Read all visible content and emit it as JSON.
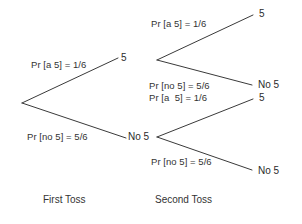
{
  "diagram": {
    "title_visible": false,
    "colors": {
      "background": "#ffffff",
      "line": "#3a3a3a",
      "label_text": "#333333",
      "node_text": "#2b2b2b"
    },
    "stage_labels": [
      {
        "id": "first-toss",
        "text": "First Toss",
        "x": 43,
        "y": 194
      },
      {
        "id": "second-toss",
        "text": "Second Toss",
        "x": 155,
        "y": 194
      }
    ],
    "branch_labels": [
      {
        "id": "first-a5",
        "text": "Pr [a 5] = 1/6",
        "x": 31,
        "y": 59
      },
      {
        "id": "first-no5",
        "text": "Pr [no 5] = 5/6",
        "x": 27,
        "y": 131
      },
      {
        "id": "second-top-a5",
        "text": "Pr [a 5] = 1/6",
        "x": 151,
        "y": 18
      },
      {
        "id": "second-top-no5",
        "text": "Pr [no 5] = 5/6",
        "x": 149,
        "y": 80
      },
      {
        "id": "second-bottom-a5",
        "text": "Pr [a  5] = 1/6",
        "x": 149,
        "y": 92
      },
      {
        "id": "second-bottom-no5",
        "text": "Pr [no 5] = 5/6",
        "x": 151,
        "y": 156
      }
    ],
    "nodes": [
      {
        "id": "first-5",
        "text": "5",
        "x": 121,
        "y": 52
      },
      {
        "id": "first-no5",
        "text": "No 5",
        "x": 128,
        "y": 131
      },
      {
        "id": "leaf-5-5",
        "text": "5",
        "x": 259,
        "y": 8
      },
      {
        "id": "leaf-5-no5",
        "text": "No 5",
        "x": 258,
        "y": 79
      },
      {
        "id": "leaf-no5-5",
        "text": "5",
        "x": 259,
        "y": 92
      },
      {
        "id": "leaf-no5-no5",
        "text": "No 5",
        "x": 258,
        "y": 165
      }
    ],
    "edges": [
      {
        "id": "edge-root-5",
        "from": [
          22,
          103
        ],
        "to": [
          118,
          58
        ]
      },
      {
        "id": "edge-root-no5",
        "from": [
          22,
          103
        ],
        "to": [
          126,
          138
        ]
      },
      {
        "id": "edge-top-5",
        "from": [
          157,
          60
        ],
        "to": [
          253,
          15
        ]
      },
      {
        "id": "edge-top-no5",
        "from": [
          157,
          60
        ],
        "to": [
          252,
          85
        ]
      },
      {
        "id": "edge-bottom-5",
        "from": [
          157,
          137
        ],
        "to": [
          253,
          99
        ]
      },
      {
        "id": "edge-bottom-no5",
        "from": [
          157,
          137
        ],
        "to": [
          252,
          170
        ]
      }
    ]
  }
}
